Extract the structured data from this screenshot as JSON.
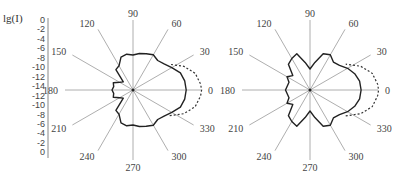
{
  "chart_data": {
    "type": "polar",
    "ylabel": "lg(I)",
    "radial_axis": {
      "ticks_upper": [
        "0",
        "-2",
        "-4",
        "-6",
        "-8",
        "-10",
        "-12",
        "-14"
      ],
      "ticks_lower": [
        "-12",
        "-10",
        "-8",
        "-6",
        "-4",
        "-2",
        "0"
      ],
      "range": [
        -14,
        0
      ]
    },
    "angle_labels": [
      "0",
      "30",
      "60",
      "90",
      "120",
      "150",
      "180",
      "210",
      "240",
      "270",
      "300",
      "330"
    ],
    "series_styles": [
      "solid",
      "dashed"
    ],
    "plots": [
      {
        "name": "left-polar-plot",
        "center": [
          133,
          90
        ],
        "radius_px": 70,
        "solid": {
          "angles_deg": [
            0,
            10,
            20,
            30,
            40,
            50,
            60,
            70,
            80,
            90,
            100,
            110,
            120,
            130,
            140,
            150,
            160,
            170,
            180,
            190,
            200,
            210,
            220,
            230,
            240,
            250,
            260,
            270,
            280,
            290,
            300,
            310,
            320,
            330,
            340,
            350
          ],
          "r": [
            0.76,
            0.75,
            0.72,
            0.64,
            0.58,
            0.55,
            0.58,
            0.55,
            0.53,
            0.5,
            0.52,
            0.5,
            0.4,
            0.38,
            0.18,
            0.22,
            0.3,
            0.28,
            0.3,
            0.28,
            0.3,
            0.22,
            0.18,
            0.38,
            0.4,
            0.5,
            0.52,
            0.5,
            0.53,
            0.55,
            0.58,
            0.55,
            0.58,
            0.64,
            0.72,
            0.75
          ]
        },
        "dashed": {
          "angles_deg": [
            -35,
            -25,
            -15,
            -5,
            0,
            5,
            15,
            25,
            35
          ],
          "r": [
            0.64,
            0.8,
            0.92,
            0.97,
            0.98,
            0.97,
            0.92,
            0.8,
            0.64
          ]
        }
      },
      {
        "name": "right-polar-plot",
        "center": [
          310,
          90
        ],
        "radius_px": 70,
        "solid": {
          "angles_deg": [
            0,
            10,
            20,
            30,
            40,
            50,
            60,
            70,
            80,
            90,
            100,
            110,
            120,
            130,
            140,
            150,
            160,
            170,
            180,
            190,
            200,
            210,
            220,
            230,
            240,
            250,
            260,
            270,
            280,
            290,
            300,
            310,
            320,
            330,
            340,
            350
          ],
          "r": [
            0.73,
            0.72,
            0.68,
            0.62,
            0.55,
            0.52,
            0.58,
            0.55,
            0.4,
            0.3,
            0.4,
            0.55,
            0.52,
            0.48,
            0.32,
            0.38,
            0.32,
            0.33,
            0.35,
            0.33,
            0.32,
            0.38,
            0.32,
            0.48,
            0.52,
            0.55,
            0.4,
            0.3,
            0.4,
            0.55,
            0.58,
            0.52,
            0.55,
            0.62,
            0.68,
            0.72
          ]
        },
        "dashed": {
          "angles_deg": [
            -36,
            -25,
            -15,
            -5,
            0,
            5,
            15,
            25,
            36
          ],
          "r": [
            0.63,
            0.8,
            0.92,
            0.97,
            0.98,
            0.97,
            0.92,
            0.8,
            0.63
          ]
        }
      }
    ]
  }
}
